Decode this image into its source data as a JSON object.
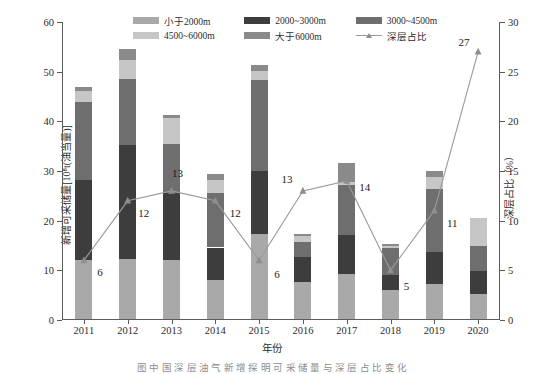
{
  "chart_data": {
    "type": "bar",
    "title": "",
    "xlabel": "年份",
    "ylabel": "新增可采储量[10⁸t(油当量)]",
    "ylabel_right": "深层占比（%）",
    "categories": [
      "2011",
      "2012",
      "2013",
      "2014",
      "2015",
      "2016",
      "2017",
      "2018",
      "2019",
      "2020"
    ],
    "ylim": [
      0,
      60
    ],
    "yticks": [
      0,
      10,
      20,
      30,
      40,
      50,
      60
    ],
    "ylim_right": [
      0,
      30
    ],
    "yticks_right": [
      0,
      5,
      10,
      15,
      20,
      25,
      30
    ],
    "grid": false,
    "legend_position": "top-center",
    "stacked": true,
    "series": [
      {
        "name": "小于2000m",
        "color": "#a9a9a9",
        "values": [
          11.8,
          12.0,
          11.9,
          7.8,
          17.2,
          7.5,
          9.0,
          5.9,
          7.0,
          5.0
        ]
      },
      {
        "name": "2000~3000m",
        "color": "#3d3d3d",
        "values": [
          16.2,
          23.0,
          13.5,
          6.6,
          12.6,
          5.0,
          7.9,
          2.9,
          6.4,
          4.6
        ]
      },
      {
        "name": "3000~4500m",
        "color": "#6e6e6e",
        "values": [
          15.7,
          13.3,
          9.9,
          10.9,
          18.3,
          3.0,
          10.1,
          5.4,
          12.8,
          5.1
        ]
      },
      {
        "name": "4500~6000m",
        "color": "#c6c6c6",
        "values": [
          2.3,
          3.8,
          5.1,
          2.6,
          1.8,
          1.3,
          0.6,
          0.6,
          2.3,
          5.6
        ]
      },
      {
        "name": "大于6000m",
        "color": "#8a8a8a",
        "values": [
          0.7,
          2.2,
          0.6,
          1.2,
          1.3,
          0.4,
          3.9,
          0.4,
          1.3,
          0.0
        ]
      }
    ],
    "line_series": {
      "name": "深层占比",
      "color": "#9a9a9a",
      "marker": "triangle",
      "axis": "right",
      "values": [
        6,
        12,
        13,
        12,
        6,
        13,
        14,
        5,
        11,
        27
      ],
      "labels": [
        "6",
        "12",
        "13",
        "12",
        "6",
        "13",
        "14",
        "5",
        "11",
        "27"
      ]
    },
    "totals": [
      46.7,
      54.3,
      41.0,
      29.1,
      51.2,
      17.2,
      31.5,
      15.2,
      29.8,
      20.3
    ]
  },
  "legend": {
    "items": [
      {
        "label": "小于2000m",
        "type": "swatch",
        "color": "#a9a9a9"
      },
      {
        "label": "2000~3000m",
        "type": "swatch",
        "color": "#3d3d3d"
      },
      {
        "label": "3000~4500m",
        "type": "swatch",
        "color": "#6e6e6e"
      },
      {
        "label": "4500~6000m",
        "type": "swatch",
        "color": "#c6c6c6"
      },
      {
        "label": "大于6000m",
        "type": "swatch",
        "color": "#8a8a8a"
      },
      {
        "label": "深层占比",
        "type": "line",
        "color": "#9a9a9a"
      }
    ]
  },
  "caption": "图  中 国 深 层 油 气 新 增 探 明 可 采 储 量 与 深 层 占 比 变 化"
}
